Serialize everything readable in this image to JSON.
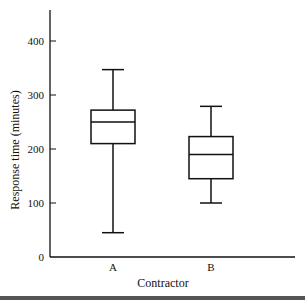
{
  "chart_data": {
    "type": "box",
    "title": "",
    "xlabel": "Contractor",
    "ylabel": "Response time (minutes)",
    "ylim": [
      0,
      450
    ],
    "yticks": [
      0,
      100,
      200,
      300,
      400
    ],
    "grid": false,
    "categories": [
      "A",
      "B"
    ],
    "series": [
      {
        "name": "A",
        "min": 45,
        "q1": 210,
        "median": 250,
        "q3": 272,
        "max": 347
      },
      {
        "name": "B",
        "min": 100,
        "q1": 145,
        "median": 190,
        "q3": 223,
        "max": 279
      }
    ]
  },
  "colors": {
    "line": "#111111",
    "frame_bar": "#555555"
  }
}
